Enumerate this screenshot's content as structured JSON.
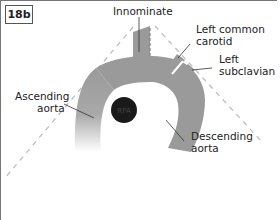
{
  "figure": {
    "label": "18b",
    "labels": {
      "innominate": "Innominate",
      "left_common_carotid_1": "Left common",
      "left_common_carotid_2": "carotid",
      "left_subclavian_1": "Left",
      "left_subclavian_2": "subclavian",
      "ascending_aorta_1": "Ascending",
      "ascending_aorta_2": "aorta",
      "descending_aorta_1": "Descending",
      "descending_aorta_2": "aorta",
      "rpa": "RPA"
    },
    "colors": {
      "vessel": "#9a9a9a",
      "rpa": "#1a1a1a",
      "dashed_line": "#bdbdbd",
      "leader_line": "#333333",
      "frame": "#777777"
    }
  }
}
